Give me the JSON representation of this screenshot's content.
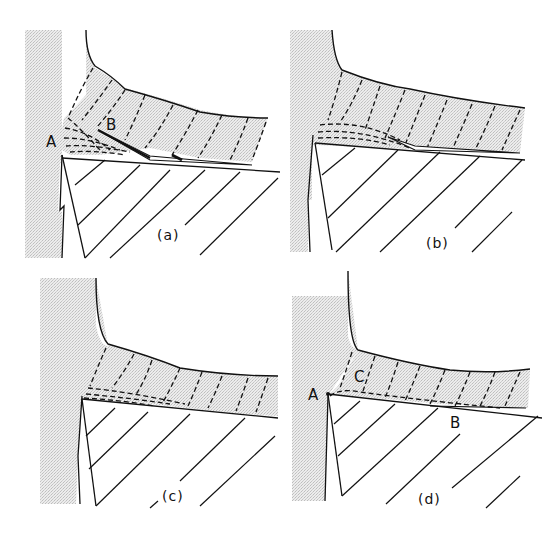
{
  "figure": {
    "colors": {
      "ink": "#111111",
      "stipple": "#d9d9d9",
      "background": "#ffffff"
    },
    "panels": [
      {
        "id": "a",
        "caption": "(a)",
        "points": {
          "A": "A",
          "B": "B"
        }
      },
      {
        "id": "b",
        "caption": "(b)",
        "points": {}
      },
      {
        "id": "c",
        "caption": "(c)",
        "points": {}
      },
      {
        "id": "d",
        "caption": "(d)",
        "points": {
          "A": "A",
          "B": "B",
          "C": "C"
        }
      }
    ]
  }
}
